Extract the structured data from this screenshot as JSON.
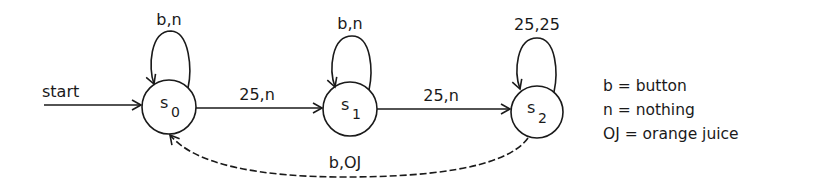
{
  "diagram": {
    "type": "finite-state-machine",
    "start_label": "start",
    "states": [
      {
        "id": "s0",
        "name": "s",
        "subscript": "0",
        "cx": 169,
        "cy": 107,
        "r": 27
      },
      {
        "id": "s1",
        "name": "s",
        "subscript": "1",
        "cx": 350,
        "cy": 109,
        "r": 27
      },
      {
        "id": "s2",
        "name": "s",
        "subscript": "2",
        "cx": 537,
        "cy": 112,
        "r": 26
      }
    ],
    "transitions": [
      {
        "from": "s0",
        "to": "s0",
        "label": "b,n",
        "style": "solid"
      },
      {
        "from": "s0",
        "to": "s1",
        "label": "25,n",
        "style": "solid"
      },
      {
        "from": "s1",
        "to": "s1",
        "label": "b,n",
        "style": "solid"
      },
      {
        "from": "s1",
        "to": "s2",
        "label": "25,n",
        "style": "solid"
      },
      {
        "from": "s2",
        "to": "s2",
        "label": "25,25",
        "style": "solid"
      },
      {
        "from": "s2",
        "to": "s0",
        "label": "b,OJ",
        "style": "dashed"
      }
    ],
    "legend": [
      "b = button",
      "n = nothing",
      "OJ = orange juice"
    ],
    "colors": {
      "ink": "#1a1a1a",
      "background": "#ffffff"
    }
  }
}
